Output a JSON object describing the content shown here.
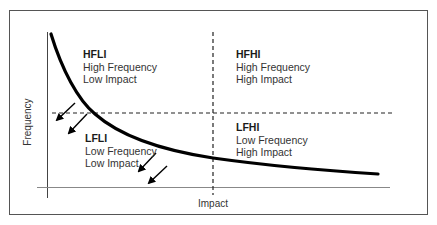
{
  "diagram": {
    "type": "risk-quadrant",
    "axes": {
      "x_label": "Impact",
      "y_label": "Frequency"
    },
    "quadrants": [
      {
        "id": "HFLI",
        "title": "HFLI",
        "line1": "High Frequency",
        "line2": "Low Impact"
      },
      {
        "id": "HFHI",
        "title": "HFHI",
        "line1": "High Frequency",
        "line2": "High Impact"
      },
      {
        "id": "LFLI",
        "title": "LFLI",
        "line1": "Low Frequency",
        "line2": "Low Impact"
      },
      {
        "id": "LFHI",
        "title": "LFHI",
        "line1": "Low Frequency",
        "line2": "High Impact"
      }
    ],
    "curve": "inverse frequency-impact curve (high frequency at low impact decreasing toward low frequency at high impact)",
    "arrows": "four arrows pointing down-left toward lower frequency and lower impact",
    "colors": {
      "line": "#000000",
      "frame": "#555555",
      "text": "#333333"
    }
  }
}
